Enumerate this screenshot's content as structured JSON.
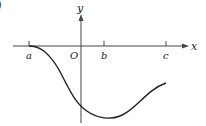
{
  "figure": {
    "partial_label": ")",
    "axes": {
      "x_label": "x",
      "y_label": "y",
      "origin_label": "O"
    },
    "ticks": [
      {
        "label": "a",
        "x": 29
      },
      {
        "label": "b",
        "x": 104
      },
      {
        "label": "c",
        "x": 166
      }
    ],
    "curve_description": "Smooth curve starting flat at x=a on the x-axis, descending below the axis, crossing the y-axis, reaching a minimum near x=b, then rising toward x=c while remaining below the axis.",
    "colors": {
      "axis": "#444444",
      "curve": "#222222",
      "background": "#ffffff"
    }
  }
}
